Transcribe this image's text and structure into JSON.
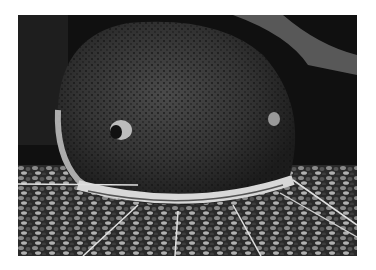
{
  "image": {
    "subject": "Catfish head, front view, resting on gravel",
    "alt": "Close-up grayscale photograph of a catfish with speckled skin, long barbels and gravel substrate"
  }
}
